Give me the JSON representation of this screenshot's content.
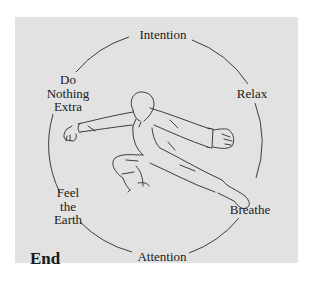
{
  "diagram": {
    "labels": {
      "top": "Intention",
      "right_upper": "Relax",
      "right_lower": "Breathe",
      "bottom": "Attention",
      "left_upper": [
        "Do",
        "Nothing",
        "Extra"
      ],
      "left_lower": [
        "Feel",
        "the",
        "Earth"
      ]
    },
    "corner_label": "End",
    "illustration": "figure-in-low-stance",
    "colors": {
      "panel_background": "#e2e2e2",
      "page_background": "#ffffff",
      "line": "#2a2a2a",
      "text": "#1a1a1a"
    }
  }
}
